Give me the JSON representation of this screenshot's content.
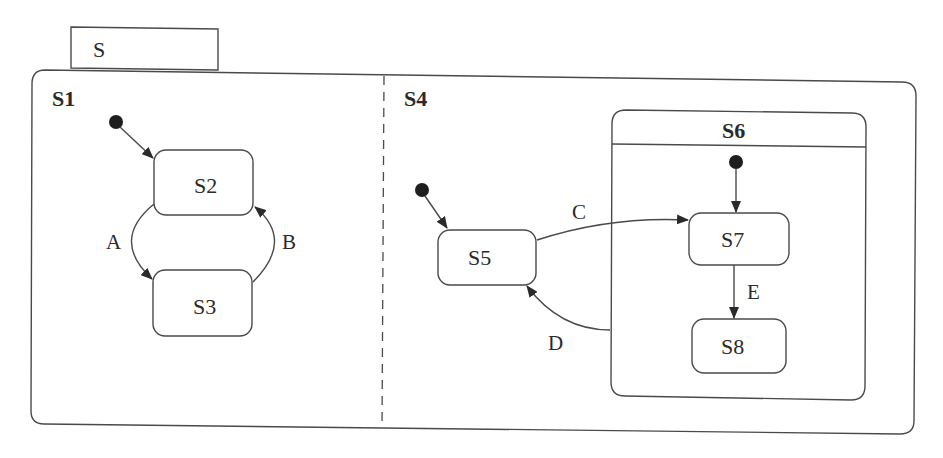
{
  "diagram": {
    "type": "uml-state-machine",
    "root": {
      "name": "S",
      "tab_label": "S"
    },
    "regions": [
      {
        "name": "S1",
        "label": "S1",
        "initial_target": "S2",
        "states": [
          {
            "id": "S2",
            "label": "S2"
          },
          {
            "id": "S3",
            "label": "S3"
          }
        ],
        "transitions": [
          {
            "from": "S2",
            "to": "S3",
            "label": "A"
          },
          {
            "from": "S3",
            "to": "S2",
            "label": "B"
          }
        ]
      },
      {
        "name": "S4",
        "label": "S4",
        "initial_target": "S5",
        "states": [
          {
            "id": "S5",
            "label": "S5"
          },
          {
            "id": "S6",
            "label": "S6",
            "initial_target": "S7",
            "substates": [
              {
                "id": "S7",
                "label": "S7"
              },
              {
                "id": "S8",
                "label": "S8"
              }
            ]
          }
        ],
        "transitions": [
          {
            "from": "S5",
            "to": "S7",
            "label": "C"
          },
          {
            "from": "S6",
            "to": "S5",
            "label": "D"
          },
          {
            "from": "S7",
            "to": "S8",
            "label": "E"
          }
        ]
      }
    ],
    "labels": {
      "S": "S",
      "S1": "S1",
      "S2": "S2",
      "S3": "S3",
      "S4": "S4",
      "S5": "S5",
      "S6": "S6",
      "S7": "S7",
      "S8": "S8",
      "A": "A",
      "B": "B",
      "C": "C",
      "D": "D",
      "E": "E"
    },
    "colors": {
      "stroke": "#4a4a4a",
      "text": "#2a2a2a",
      "initial_dot": "#1e1e1e",
      "background": "#ffffff"
    }
  }
}
